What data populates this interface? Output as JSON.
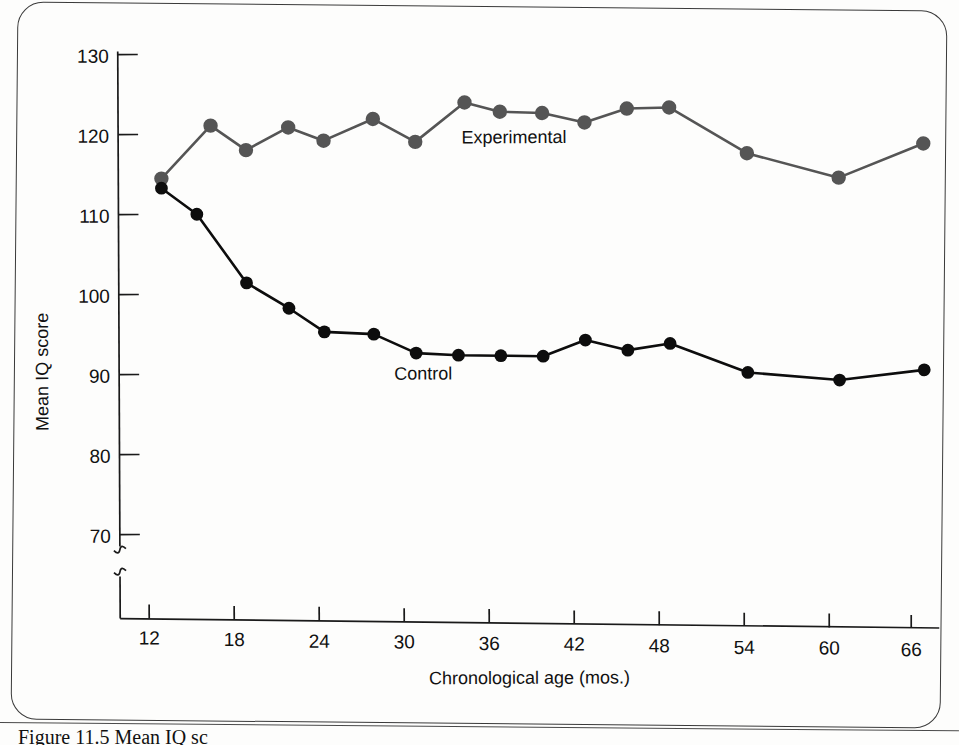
{
  "figure": {
    "caption": "Figure 11.5   Mean IQ sc",
    "frame_shape": "rounded-rectangle"
  },
  "chart_data": {
    "type": "line",
    "title": "",
    "xlabel": "Chronological age (mos.)",
    "ylabel": "Mean IQ score",
    "xlim": [
      10,
      69
    ],
    "ylim": [
      65,
      132
    ],
    "xticks": [
      12,
      18,
      24,
      30,
      36,
      42,
      48,
      54,
      60,
      66
    ],
    "yticks": [
      70,
      80,
      90,
      100,
      110,
      120,
      130
    ],
    "grid": false,
    "legend_position": "inline-annotation",
    "y_axis_break": true,
    "x": [
      13,
      15,
      16.5,
      19,
      22,
      24.5,
      28,
      31,
      34.5,
      37,
      40,
      43,
      46,
      49,
      54.5,
      61,
      67
    ],
    "series": [
      {
        "name": "Experimental",
        "color": "#555555",
        "values": [
          114.5,
          121.2,
          118.2,
          121.1,
          119.5,
          122.3,
          119.5,
          124.5,
          123.4,
          123.3,
          122.2,
          124.0,
          124.2,
          118.6,
          115.7,
          120.1
        ],
        "x": [
          13,
          16.5,
          19,
          22,
          24.5,
          28,
          31,
          34.5,
          37,
          40,
          43,
          46,
          49,
          54.5,
          61,
          67
        ]
      },
      {
        "name": "Control",
        "color": "#0d0d0d",
        "values": [
          113.3,
          110.1,
          101.6,
          98.5,
          95.6,
          95.4,
          93.1,
          92.9,
          92.9,
          92.9,
          95.0,
          93.8,
          94.7,
          91.2,
          90.4,
          91.8
        ],
        "x": [
          13,
          15.5,
          19,
          22,
          24.5,
          28,
          31,
          34,
          37,
          40,
          43,
          46,
          49,
          54.5,
          61,
          67
        ]
      }
    ],
    "annotations": [
      {
        "text": "Experimental",
        "x": 38,
        "y": 119.5
      },
      {
        "text": "Control",
        "x": 31.5,
        "y": 89.8
      }
    ]
  }
}
